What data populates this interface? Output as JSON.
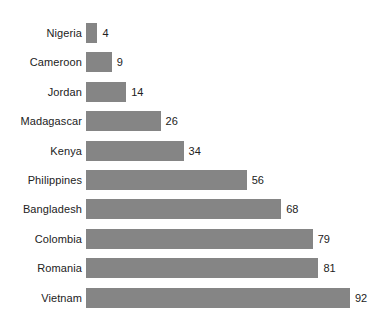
{
  "chart_data": {
    "type": "bar",
    "orientation": "horizontal",
    "title": "",
    "subtitle": "",
    "xlabel": "",
    "ylabel": "",
    "grid": false,
    "legend": null,
    "xlim": [
      0,
      92
    ],
    "categories": [
      "Nigeria",
      "Cameroon",
      "Jordan",
      "Madagascar",
      "Kenya",
      "Philippines",
      "Bangladesh",
      "Colombia",
      "Romania",
      "Vietnam"
    ],
    "values": [
      4,
      9,
      14,
      26,
      34,
      56,
      68,
      79,
      81,
      92
    ],
    "value_labels": [
      "4",
      "9",
      "14",
      "26",
      "34",
      "56",
      "68",
      "79",
      "81",
      "92"
    ],
    "bar_color": "#858585",
    "background_color": "#ffffff",
    "text_color": "#222222"
  }
}
